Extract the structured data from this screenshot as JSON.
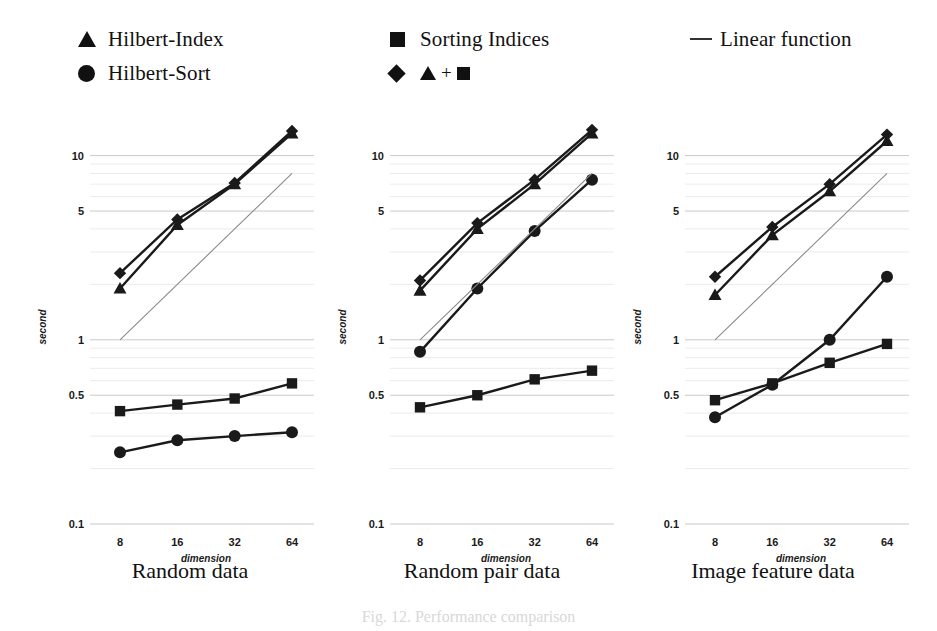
{
  "legend": {
    "items": [
      {
        "label": "Hilbert-Index",
        "marker": "triangle",
        "column": 1,
        "row": 1
      },
      {
        "label": "Hilbert-Sort",
        "marker": "circle",
        "column": 1,
        "row": 2
      },
      {
        "label": "Sorting Indices",
        "marker": "square",
        "column": 2,
        "row": 1
      },
      {
        "label": "▲ + ■",
        "marker": "diamond",
        "column": 2,
        "row": 2
      },
      {
        "label": "Linear function",
        "marker": "line",
        "column": 3,
        "row": 1
      }
    ]
  },
  "caption": "Fig. 12.  Performance comparison",
  "colors": {
    "series": "#1a1a1a",
    "linear": "#8a8a8a",
    "grid": "#c9c9c9",
    "gridMinor": "#e2e2e2",
    "text": "#111111"
  },
  "axis": {
    "ylabel": "second",
    "xlabel": "dimension",
    "yticks": [
      10,
      5,
      1,
      0.5,
      0.1
    ],
    "yticklabels": [
      "10",
      "5",
      "1",
      "0.5",
      "0.1"
    ],
    "xticks": [
      8,
      16,
      32,
      64
    ],
    "xticklabels": [
      "8",
      "16",
      "32",
      "64"
    ],
    "ylim": [
      0.1,
      16
    ],
    "yscale": "log",
    "xscale": "log2",
    "grid": true
  },
  "chart_data": [
    {
      "type": "line",
      "title": "Random data",
      "xlabel": "dimension",
      "ylabel": "second",
      "x": [
        8,
        16,
        32,
        64
      ],
      "categories": [
        "8",
        "16",
        "32",
        "64"
      ],
      "yscale": "log",
      "ylim": [
        0.1,
        16
      ],
      "grid": true,
      "legend_position": "top",
      "series": [
        {
          "name": "Hilbert-Index",
          "marker": "triangle",
          "values": [
            1.9,
            4.2,
            7.0,
            13.2
          ]
        },
        {
          "name": "Hilbert-Sort",
          "marker": "circle",
          "values": [
            0.245,
            0.285,
            0.3,
            0.315
          ]
        },
        {
          "name": "Sorting Indices",
          "marker": "square",
          "values": [
            0.41,
            0.445,
            0.48,
            0.58
          ]
        },
        {
          "name": "▲ + ■",
          "marker": "diamond",
          "values": [
            2.3,
            4.5,
            7.1,
            13.6
          ]
        },
        {
          "name": "Linear function",
          "marker": "none",
          "values": [
            1.0,
            2.0,
            4.0,
            8.0
          ]
        }
      ]
    },
    {
      "type": "line",
      "title": "Random pair data",
      "xlabel": "dimension",
      "ylabel": "second",
      "x": [
        8,
        16,
        32,
        64
      ],
      "categories": [
        "8",
        "16",
        "32",
        "64"
      ],
      "yscale": "log",
      "ylim": [
        0.1,
        16
      ],
      "grid": true,
      "legend_position": "top",
      "series": [
        {
          "name": "Hilbert-Index",
          "marker": "triangle",
          "values": [
            1.85,
            4.0,
            7.0,
            13.2
          ]
        },
        {
          "name": "Hilbert-Sort",
          "marker": "circle",
          "values": [
            0.86,
            1.9,
            3.9,
            7.4
          ]
        },
        {
          "name": "Sorting Indices",
          "marker": "square",
          "values": [
            0.43,
            0.5,
            0.61,
            0.68
          ]
        },
        {
          "name": "▲ + ■",
          "marker": "diamond",
          "values": [
            2.1,
            4.3,
            7.4,
            13.8
          ]
        },
        {
          "name": "Linear function",
          "marker": "none",
          "values": [
            1.0,
            2.0,
            4.0,
            8.0
          ]
        }
      ]
    },
    {
      "type": "line",
      "title": "Image feature data",
      "xlabel": "dimension",
      "ylabel": "second",
      "x": [
        8,
        16,
        32,
        64
      ],
      "categories": [
        "8",
        "16",
        "32",
        "64"
      ],
      "yscale": "log",
      "ylim": [
        0.1,
        16
      ],
      "grid": true,
      "legend_position": "top",
      "series": [
        {
          "name": "Hilbert-Index",
          "marker": "triangle",
          "values": [
            1.75,
            3.7,
            6.4,
            12.0
          ]
        },
        {
          "name": "Hilbert-Sort",
          "marker": "circle",
          "values": [
            0.38,
            0.57,
            1.0,
            2.2
          ]
        },
        {
          "name": "Sorting Indices",
          "marker": "square",
          "values": [
            0.47,
            0.58,
            0.75,
            0.95
          ]
        },
        {
          "name": "▲ + ■",
          "marker": "diamond",
          "values": [
            2.2,
            4.1,
            7.0,
            13.0
          ]
        },
        {
          "name": "Linear function",
          "marker": "none",
          "values": [
            1.0,
            2.0,
            4.0,
            8.0
          ]
        }
      ]
    }
  ]
}
